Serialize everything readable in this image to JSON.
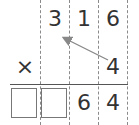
{
  "problem": {
    "multiplicand": [
      "3",
      "1",
      "6"
    ],
    "operator": "×",
    "multiplier": "4",
    "result_known_digits": [
      "6",
      "4"
    ],
    "result_blank_boxes": 2
  },
  "colors": {
    "digit": "#333333",
    "arrow": "#888888",
    "grid": "#8a8a8a"
  }
}
